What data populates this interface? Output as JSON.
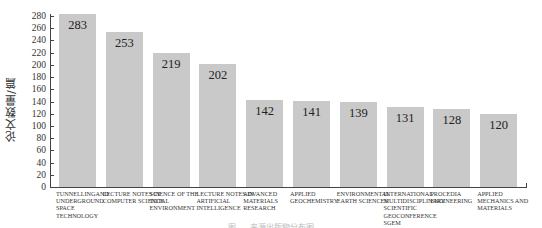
{
  "chart_data": {
    "type": "bar",
    "title": "",
    "xlabel": "",
    "ylabel": "论文数量/篇",
    "ylim": [
      0,
      280
    ],
    "yticks": [
      0,
      20,
      40,
      60,
      80,
      100,
      120,
      140,
      160,
      180,
      200,
      220,
      240,
      260,
      280
    ],
    "grid": false,
    "legend": null,
    "bar_color": "#c9c9c9",
    "categories": [
      "TUNNELLINGAND UNDERGROUND SPACE TECHNOLOGY",
      "LECTURE NOTES IN COMPUTER SCIENCE",
      "SCIENCE OF THE TOTAL ENVIRONMENT",
      "LECTURE NOTES IN ARTIFICIAL INTELLIGENCE",
      "ADVANCED MATERIALS RESEARCH",
      "APPLIED GEOCHEMISTRY",
      "ENVIRONMENTAL EARTH SCIENCES",
      "INTERNATIONAL MULTIDISCIPLINARY SCIENTIFIC GEOCONFERENCE SGEM",
      "PROCEDIA ENGINEERING",
      "APPLIED MECHANICS AND MATERIALS"
    ],
    "values": [
      283,
      253,
      219,
      202,
      142,
      141,
      139,
      131,
      128,
      120
    ],
    "data_labels": [
      "283",
      "253",
      "219",
      "202",
      "142",
      "141",
      "139",
      "131",
      "128",
      "120"
    ]
  },
  "caption": "图 … 来源出版物分布图"
}
